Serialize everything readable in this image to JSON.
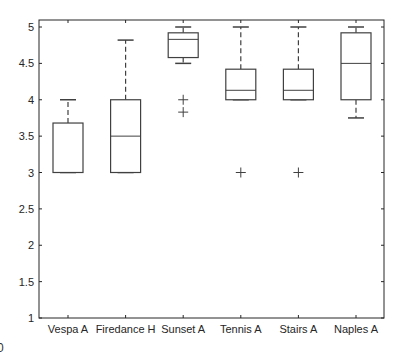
{
  "chart_data": {
    "type": "boxplot",
    "title": "",
    "xlabel": "",
    "ylabel": "",
    "ylim": [
      1,
      5
    ],
    "yticks": [
      1,
      1.5,
      2,
      2.5,
      3,
      3.5,
      4,
      4.5,
      5
    ],
    "ytick_labels": [
      "1",
      "1.5",
      "2",
      "2.5",
      "3",
      "3.5",
      "4",
      "4.5",
      "5"
    ],
    "grid": false,
    "legend": null,
    "categories": [
      "Vespa A",
      "Firedance H",
      "Sunset A",
      "Tennis A",
      "Stairs A",
      "Naples A"
    ],
    "series": [
      {
        "name": "Vespa A",
        "whisker_low": 3.0,
        "q1": 3.0,
        "median": 3.0,
        "q3": 3.68,
        "whisker_high": 4.0,
        "outliers": []
      },
      {
        "name": "Firedance H",
        "whisker_low": 3.0,
        "q1": 3.0,
        "median": 3.5,
        "q3": 4.0,
        "whisker_high": 4.82,
        "outliers": []
      },
      {
        "name": "Sunset A",
        "whisker_low": 4.5,
        "q1": 4.58,
        "median": 4.83,
        "q3": 4.92,
        "whisker_high": 5.0,
        "outliers": [
          4.0,
          3.83
        ]
      },
      {
        "name": "Tennis A",
        "whisker_low": 4.0,
        "q1": 4.0,
        "median": 4.13,
        "q3": 4.42,
        "whisker_high": 5.0,
        "outliers": [
          3.0
        ]
      },
      {
        "name": "Stairs A",
        "whisker_low": 4.0,
        "q1": 4.0,
        "median": 4.13,
        "q3": 4.42,
        "whisker_high": 5.0,
        "outliers": [
          3.0
        ]
      },
      {
        "name": "Naples A",
        "whisker_low": 3.75,
        "q1": 4.0,
        "median": 4.5,
        "q3": 4.92,
        "whisker_high": 5.0,
        "outliers": []
      }
    ],
    "colors": {
      "box": "#404040",
      "axis": "#262626",
      "outlier": "#404040"
    }
  },
  "page": {
    "corner_glyph": "0"
  }
}
